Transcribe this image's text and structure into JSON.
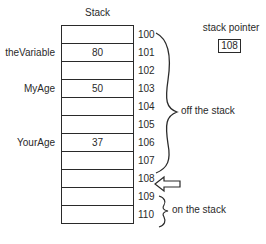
{
  "title": "Stack",
  "rows": [
    {
      "address": "100",
      "value": "",
      "variable": ""
    },
    {
      "address": "101",
      "value": "80",
      "variable": "theVariable"
    },
    {
      "address": "102",
      "value": "",
      "variable": ""
    },
    {
      "address": "103",
      "value": "50",
      "variable": "MyAge"
    },
    {
      "address": "104",
      "value": "",
      "variable": ""
    },
    {
      "address": "105",
      "value": "",
      "variable": ""
    },
    {
      "address": "106",
      "value": "37",
      "variable": "YourAge"
    },
    {
      "address": "107",
      "value": "",
      "variable": ""
    },
    {
      "address": "108",
      "value": "",
      "variable": ""
    },
    {
      "address": "109",
      "value": "",
      "variable": ""
    },
    {
      "address": "110",
      "value": "",
      "variable": ""
    }
  ],
  "stack_pointer": {
    "label": "stack pointer",
    "value": "108"
  },
  "annotations": {
    "off_the_stack": "off the stack",
    "on_the_stack": "on the stack"
  },
  "colors": {
    "line": "#2a2a2a",
    "background": "#ffffff"
  }
}
